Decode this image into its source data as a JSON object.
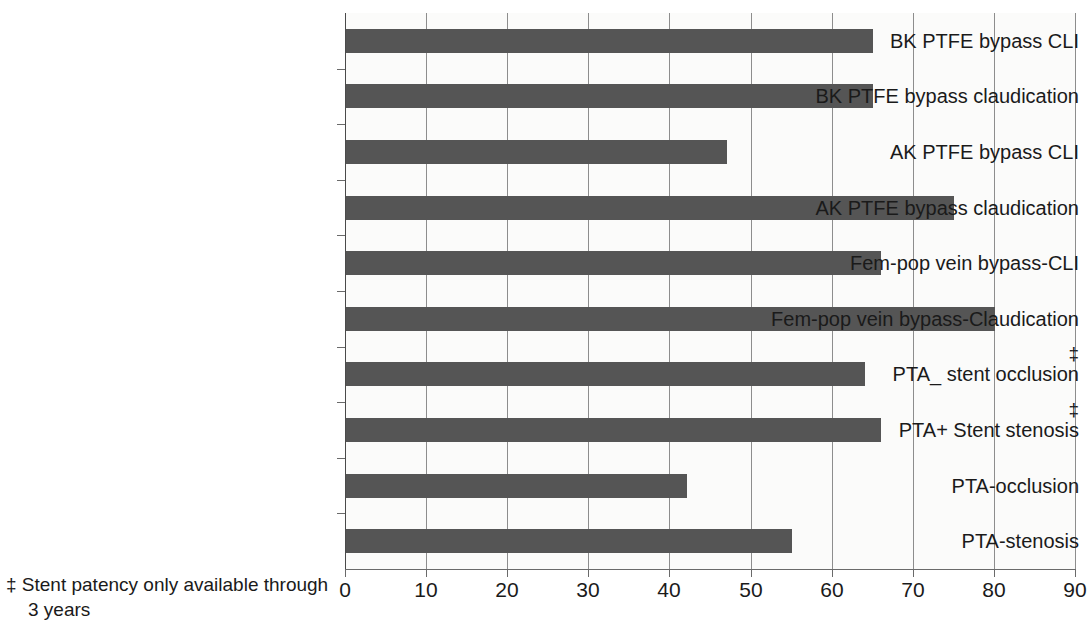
{
  "chart_data": {
    "type": "bar",
    "orientation": "horizontal",
    "title": "",
    "xlabel": "",
    "ylabel": "",
    "xlim": [
      0,
      90
    ],
    "xticks": [
      "0",
      "10",
      "20",
      "30",
      "40",
      "50",
      "60",
      "70",
      "80",
      "90"
    ],
    "xtick_step": 10,
    "grid": true,
    "legend": "none",
    "bar_color": "#555555",
    "plot_background": "#fbfbfa",
    "categories": [
      "BK PTFE bypass CLI",
      "BK PTFE bypass claudication",
      "AK PTFE bypass CLI",
      "AK PTFE bypass claudication",
      "Fem-pop vein bypass-CLI",
      "Fem-pop vein bypass-Claudication",
      "PTA_ stent occlusion",
      "PTA+ Stent stenosis",
      "PTA-occlusion",
      "PTA-stenosis"
    ],
    "values": [
      65,
      65,
      47,
      75,
      66,
      80,
      64,
      66,
      42,
      55
    ],
    "annotations": {
      "dagger_symbol": "‡",
      "dagger_categories": [
        "PTA_ stent occlusion",
        "PTA+ Stent stenosis"
      ],
      "footnote_line1": "‡ Stent patency only available through",
      "footnote_line2": "3 years"
    }
  }
}
